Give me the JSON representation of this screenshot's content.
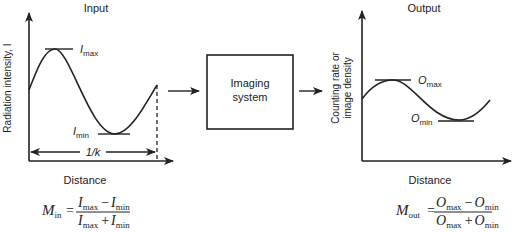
{
  "input": {
    "title": "Input",
    "y_label": "Radiation intensity, I",
    "x_label": "Distance",
    "max_label": {
      "main": "I",
      "sub": "max"
    },
    "min_label": {
      "main": "I",
      "sub": "min"
    },
    "period_label": "1/k",
    "formula": {
      "lhs_main": "M",
      "lhs_sub": "in",
      "num_a": "I",
      "num_a_sub": "max",
      "num_op": "−",
      "num_b": "I",
      "num_b_sub": "min",
      "den_a": "I",
      "den_a_sub": "max",
      "den_op": "+",
      "den_b": "I",
      "den_b_sub": "min"
    }
  },
  "system": {
    "line1": "Imaging",
    "line2": "system"
  },
  "output": {
    "title": "Output",
    "y_label_line1": "Counting rate or",
    "y_label_line2": "image density",
    "x_label": "Distance",
    "max_label": {
      "main": "O",
      "sub": "max"
    },
    "min_label": {
      "main": "O",
      "sub": "min"
    },
    "formula": {
      "lhs_main": "M",
      "lhs_sub": "out",
      "num_a": "O",
      "num_a_sub": "max",
      "num_op": "−",
      "num_b": "O",
      "num_b_sub": "min",
      "den_a": "O",
      "den_a_sub": "max",
      "den_op": "+",
      "den_b": "O",
      "den_b_sub": "min"
    }
  },
  "colors": {
    "ink": "#222222",
    "background": "#ffffff"
  }
}
